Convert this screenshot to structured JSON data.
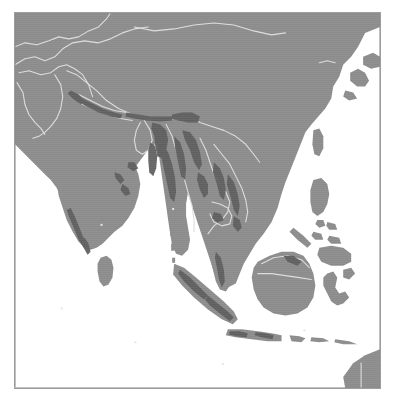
{
  "document": {
    "type": "distribution-map",
    "title": "",
    "caption": ""
  },
  "map": {
    "region_name": "South and Southeast Asia",
    "projection_hint": "equirectangular",
    "background_label": "ocean",
    "frame": {
      "border_color": "#9d9d9d",
      "border_width_px": 1,
      "x": 14,
      "y": 12,
      "width": 367,
      "height": 377
    },
    "legend": {
      "visible": false,
      "entries": [
        {
          "label": "land",
          "color": "#8b8b8b"
        },
        {
          "label": "ocean",
          "color": "#ffffff"
        },
        {
          "label": "distribution range",
          "color": "#5d5d5d"
        },
        {
          "label": "country boundary",
          "color": "#dcdcdc"
        }
      ]
    },
    "colors": {
      "land": "#8b8b8b",
      "ocean": "#ffffff",
      "range_shading": "#5d5d5d",
      "boundary_line": "#dcdcdc",
      "coastline": "#8b8b8b",
      "frame": "#9d9d9d",
      "page": "#ffffff"
    },
    "landmasses": [
      "Asian mainland",
      "Indian subcontinent",
      "Sri Lanka",
      "Indochina",
      "Malay Peninsula",
      "Sumatra",
      "Java",
      "Borneo",
      "Sulawesi",
      "Philippines",
      "Taiwan",
      "Hainan",
      "Korean Peninsula",
      "Japan (Kyushu/Shikoku)",
      "Lesser Sunda Islands",
      "New Guinea"
    ],
    "range_areas": [
      "Himalayan foothills (Uttarakhand to Nepal)",
      "Sikkim / Bhutan / Arunachal Pradesh",
      "Northeast India and Bangladesh hills",
      "Myanmar (Arakan and Shan hills)",
      "Thailand / Laos / Vietnam highlands",
      "Western Ghats (southern India)",
      "Eastern Ghats (Odisha / Andhra)",
      "Malay Peninsula",
      "Sumatra",
      "Java"
    ],
    "country_boundaries_shown": true,
    "graticule_shown": false,
    "labels": []
  }
}
